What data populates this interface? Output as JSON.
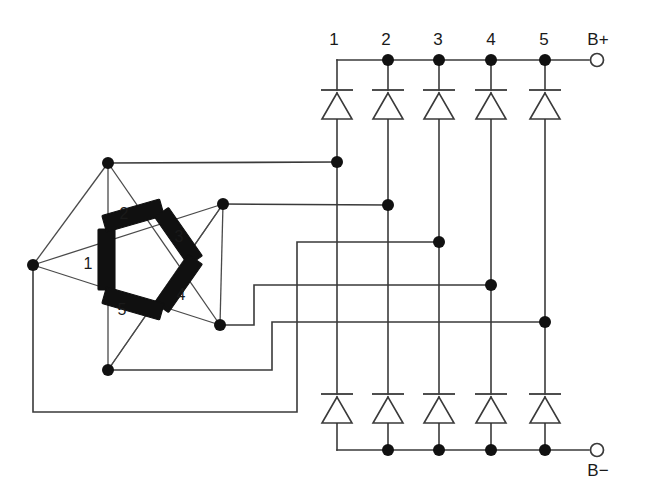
{
  "diagram": {
    "type": "electrical-schematic",
    "background_color": "#ffffff",
    "line_color": "#3a3a3a",
    "node_color": "#111111",
    "coil_color": "#101010"
  },
  "phase_labels": [
    {
      "text": "1",
      "x": 334,
      "y": 41
    },
    {
      "text": "2",
      "x": 386,
      "y": 41
    },
    {
      "text": "3",
      "x": 438,
      "y": 41
    },
    {
      "text": "4",
      "x": 491,
      "y": 41
    },
    {
      "text": "5",
      "x": 544,
      "y": 41
    }
  ],
  "terminals": [
    {
      "name": "b-plus",
      "label": "B+",
      "label_x": 598,
      "label_y": 41,
      "dot_x": 597,
      "dot_y": 60
    },
    {
      "name": "b-minus",
      "label": "B−",
      "label_x": 598,
      "label_y": 472,
      "dot_x": 597,
      "dot_y": 450
    }
  ],
  "rails": {
    "top_y": 60,
    "bottom_y": 450,
    "left_x": 337,
    "right_x": 589
  },
  "columns": {
    "x": [
      337,
      388,
      439,
      491,
      545
    ],
    "junction_dots_top": [
      false,
      true,
      true,
      true,
      true
    ],
    "junction_dots_bottom": [
      false,
      true,
      true,
      true,
      true
    ]
  },
  "diodes": {
    "count_top": 5,
    "count_bottom": 5,
    "orientation": "cathode-up",
    "top": {
      "bar_y": 90,
      "apex_y": 93,
      "base_y": 119,
      "half_width": 15,
      "bar_half_width": 16
    },
    "bottom": {
      "bar_y": 394,
      "apex_y": 397,
      "base_y": 423,
      "half_width": 15,
      "bar_half_width": 16
    }
  },
  "taps": [
    {
      "phase": 1,
      "y": 162,
      "dot_x": 337,
      "from_node": "pent-top"
    },
    {
      "phase": 2,
      "y": 205,
      "dot_x": 388,
      "from_node": "pent-upper-right"
    },
    {
      "phase": 3,
      "y": 242,
      "dot_x": 439,
      "from_node": "pent-left"
    },
    {
      "phase": 4,
      "y": 285,
      "dot_x": 491,
      "from_node": "pent-lower-right"
    },
    {
      "phase": 5,
      "y": 322,
      "dot_x": 545,
      "from_node": "pent-bottom"
    }
  ],
  "pentagon": {
    "description": "Five-phase pentagon/mesh winding drawn as a star-of-five with coil bodies on the inner pentagon edges",
    "outer_nodes": [
      {
        "name": "pent-top",
        "x": 108,
        "y": 163
      },
      {
        "name": "pent-upper-right",
        "x": 223,
        "y": 204
      },
      {
        "name": "pent-lower-right",
        "x": 220,
        "y": 325
      },
      {
        "name": "pent-bottom",
        "x": 108,
        "y": 370
      },
      {
        "name": "pent-left",
        "x": 33,
        "y": 265
      }
    ],
    "inner_vertices": [
      {
        "x": 106,
        "y": 229
      },
      {
        "x": 161,
        "y": 213
      },
      {
        "x": 195,
        "y": 260
      },
      {
        "x": 161,
        "y": 306
      },
      {
        "x": 106,
        "y": 290
      }
    ],
    "coil_labels": [
      {
        "text": "1",
        "x": 88,
        "y": 265
      },
      {
        "text": "2",
        "x": 124,
        "y": 215
      },
      {
        "text": "3",
        "x": 179,
        "y": 238
      },
      {
        "text": "4",
        "x": 181,
        "y": 296
      },
      {
        "text": "5",
        "x": 122,
        "y": 311
      }
    ]
  },
  "routing": {
    "tap1": "from (108,163) right to (337,162)",
    "tap2": "from (223,204) right to (388,205)",
    "tap3": "from (33,265) down to (412) right to (297,412) up to (322) — long lower return",
    "tap4": "from (220,325) right/step to (491,285)",
    "tap5": "from (108,370) right/step to (545,322)"
  }
}
